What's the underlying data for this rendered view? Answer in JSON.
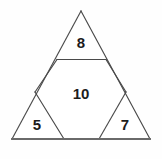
{
  "figure": {
    "background_color": "#fefefe",
    "line_color": "#4a4a4a",
    "base_line_color": "#6a6a6a",
    "label_color": "#1c1c1c",
    "outer_shape": "triangle",
    "outer_vertices": [
      [
        81,
        11
      ],
      [
        150,
        139
      ],
      [
        12,
        139
      ]
    ],
    "regions": [
      {
        "id": "top-triangle",
        "shape": "triangle",
        "label": "8",
        "label_x": 81,
        "label_y": 42,
        "vertices": [
          [
            81,
            11
          ],
          [
            106,
            59.5
          ],
          [
            57,
            59.5
          ]
        ]
      },
      {
        "id": "center-hexagon",
        "shape": "hexagon",
        "label": "10",
        "label_x": 81,
        "label_y": 93,
        "vertices": [
          [
            57,
            59.5
          ],
          [
            106,
            59.5
          ],
          [
            126,
            92
          ],
          [
            99,
            139
          ],
          [
            64,
            139
          ],
          [
            35,
            92
          ]
        ]
      },
      {
        "id": "bottom-left-triangle",
        "shape": "triangle",
        "label": "5",
        "label_x": 37,
        "label_y": 124,
        "vertices": [
          [
            35,
            92
          ],
          [
            64,
            139
          ],
          [
            12,
            139
          ]
        ]
      },
      {
        "id": "bottom-right-triangle",
        "shape": "triangle",
        "label": "7",
        "label_x": 125,
        "label_y": 124,
        "vertices": [
          [
            126,
            92
          ],
          [
            150,
            139
          ],
          [
            99,
            139
          ]
        ]
      }
    ],
    "edges": {
      "outer_left": "M 81 11 L 12 139",
      "outer_right": "M 81 11 L 150 139",
      "base": "M 12 139 L 150 139",
      "top_divider": "M 57 59.5 L 106 59.5",
      "hex_left_upper": "M 57 59.5 L 35 92",
      "hex_left_lower": "M 35 92 L 64 139",
      "hex_right_upper": "M 106 59.5 L 126 92",
      "hex_right_lower": "M 126 92 L 99 139"
    }
  }
}
